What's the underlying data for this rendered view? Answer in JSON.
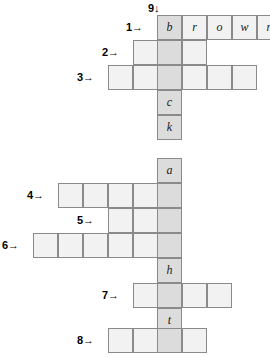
{
  "puzzle": {
    "type": "crossword",
    "cell_size": 25,
    "shaded_column_x": 157,
    "labels": [
      {
        "id": "label-9",
        "text": "9↓",
        "x": 148,
        "y": 1,
        "direction": "down"
      },
      {
        "id": "label-1",
        "text": "1→",
        "x": 126,
        "y": 15,
        "direction": "across"
      },
      {
        "id": "label-2",
        "text": "2→",
        "x": 102,
        "y": 40,
        "direction": "across"
      },
      {
        "id": "label-3",
        "text": "3→",
        "x": 77,
        "y": 65,
        "direction": "across"
      },
      {
        "id": "label-4",
        "text": "4→",
        "x": 27,
        "y": 183,
        "direction": "across"
      },
      {
        "id": "label-5",
        "text": "5→",
        "x": 77,
        "y": 208,
        "direction": "across"
      },
      {
        "id": "label-6",
        "text": "6→",
        "x": 2,
        "y": 233,
        "direction": "across"
      },
      {
        "id": "label-7",
        "text": "7→",
        "x": 102,
        "y": 283,
        "direction": "across"
      },
      {
        "id": "label-8",
        "text": "8→",
        "x": 77,
        "y": 328,
        "direction": "across"
      }
    ],
    "cells": [
      {
        "x": 157,
        "y": 15,
        "letter": "b",
        "shaded": true
      },
      {
        "x": 182,
        "y": 15,
        "letter": "r",
        "shaded": false
      },
      {
        "x": 207,
        "y": 15,
        "letter": "o",
        "shaded": false
      },
      {
        "x": 232,
        "y": 15,
        "letter": "w",
        "shaded": false
      },
      {
        "x": 257,
        "y": 15,
        "letter": "n",
        "shaded": false
      },
      {
        "x": 133,
        "y": 40,
        "letter": "",
        "shaded": false
      },
      {
        "x": 157,
        "y": 40,
        "letter": "",
        "shaded": true
      },
      {
        "x": 182,
        "y": 40,
        "letter": "",
        "shaded": false
      },
      {
        "x": 108,
        "y": 65,
        "letter": "",
        "shaded": false
      },
      {
        "x": 133,
        "y": 65,
        "letter": "",
        "shaded": false
      },
      {
        "x": 157,
        "y": 65,
        "letter": "",
        "shaded": true
      },
      {
        "x": 182,
        "y": 65,
        "letter": "",
        "shaded": false
      },
      {
        "x": 207,
        "y": 65,
        "letter": "",
        "shaded": false
      },
      {
        "x": 232,
        "y": 65,
        "letter": "",
        "shaded": false
      },
      {
        "x": 157,
        "y": 90,
        "letter": "c",
        "shaded": true
      },
      {
        "x": 157,
        "y": 115,
        "letter": "k",
        "shaded": true
      },
      {
        "x": 157,
        "y": 158,
        "letter": "a",
        "shaded": true
      },
      {
        "x": 58,
        "y": 183,
        "letter": "",
        "shaded": false
      },
      {
        "x": 83,
        "y": 183,
        "letter": "",
        "shaded": false
      },
      {
        "x": 108,
        "y": 183,
        "letter": "",
        "shaded": false
      },
      {
        "x": 133,
        "y": 183,
        "letter": "",
        "shaded": false
      },
      {
        "x": 157,
        "y": 183,
        "letter": "",
        "shaded": true
      },
      {
        "x": 108,
        "y": 208,
        "letter": "",
        "shaded": false
      },
      {
        "x": 133,
        "y": 208,
        "letter": "",
        "shaded": false
      },
      {
        "x": 157,
        "y": 208,
        "letter": "",
        "shaded": true
      },
      {
        "x": 33,
        "y": 233,
        "letter": "",
        "shaded": false
      },
      {
        "x": 58,
        "y": 233,
        "letter": "",
        "shaded": false
      },
      {
        "x": 83,
        "y": 233,
        "letter": "",
        "shaded": false
      },
      {
        "x": 108,
        "y": 233,
        "letter": "",
        "shaded": false
      },
      {
        "x": 133,
        "y": 233,
        "letter": "",
        "shaded": false
      },
      {
        "x": 157,
        "y": 233,
        "letter": "",
        "shaded": true
      },
      {
        "x": 157,
        "y": 258,
        "letter": "h",
        "shaded": true
      },
      {
        "x": 133,
        "y": 283,
        "letter": "",
        "shaded": false
      },
      {
        "x": 157,
        "y": 283,
        "letter": "",
        "shaded": true
      },
      {
        "x": 182,
        "y": 283,
        "letter": "",
        "shaded": false
      },
      {
        "x": 207,
        "y": 283,
        "letter": "",
        "shaded": false
      },
      {
        "x": 157,
        "y": 308,
        "letter": "t",
        "shaded": true
      },
      {
        "x": 108,
        "y": 328,
        "letter": "",
        "shaded": false
      },
      {
        "x": 133,
        "y": 328,
        "letter": "",
        "shaded": false
      },
      {
        "x": 157,
        "y": 328,
        "letter": "",
        "shaded": true
      },
      {
        "x": 182,
        "y": 328,
        "letter": "",
        "shaded": false
      }
    ]
  }
}
